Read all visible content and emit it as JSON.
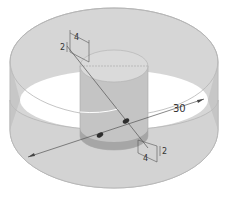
{
  "diagram": {
    "type": "isometric-cylinder-drawing",
    "labels": {
      "outer_diameter": "30",
      "top_width": "4",
      "top_height": "2",
      "bottom_width": "4",
      "bottom_height": "2"
    },
    "colors": {
      "background": "#ffffff",
      "outer_wall": "#d4d4d4",
      "outer_wall_edge": "#bdbdbd",
      "inner_hole": "#ffffff",
      "inner_cylinder_side": "#c2c2c2",
      "inner_cylinder_top": "#d9d9d9",
      "inner_cylinder_shadow": "#a9a9a9",
      "line": "#555555",
      "arrow": "#333333"
    }
  }
}
